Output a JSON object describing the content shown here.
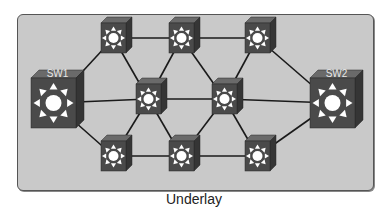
{
  "caption": "Underlay",
  "colors": {
    "panel_bg": "#c9c9c9",
    "switch_front": "#4a4a4a",
    "switch_top": "#6a6a6a",
    "switch_side": "#353535",
    "link": "#1a1a1a",
    "icon": "#ffffff"
  },
  "nodes": [
    {
      "id": "SW1",
      "label": "SW1",
      "x": 31,
      "y": 78,
      "w": 45,
      "h": 50,
      "big": true
    },
    {
      "id": "SW2",
      "label": "SW2",
      "x": 310,
      "y": 78,
      "w": 45,
      "h": 50,
      "big": true
    },
    {
      "id": "T1",
      "label": "",
      "x": 101,
      "y": 23,
      "w": 25,
      "h": 30
    },
    {
      "id": "T2",
      "label": "",
      "x": 169,
      "y": 23,
      "w": 25,
      "h": 30
    },
    {
      "id": "T3",
      "label": "",
      "x": 245,
      "y": 23,
      "w": 25,
      "h": 30
    },
    {
      "id": "M1",
      "label": "",
      "x": 136,
      "y": 84,
      "w": 25,
      "h": 30
    },
    {
      "id": "M2",
      "label": "",
      "x": 212,
      "y": 84,
      "w": 25,
      "h": 30
    },
    {
      "id": "B1",
      "label": "",
      "x": 101,
      "y": 141,
      "w": 25,
      "h": 30
    },
    {
      "id": "B2",
      "label": "",
      "x": 169,
      "y": 141,
      "w": 25,
      "h": 30
    },
    {
      "id": "B3",
      "label": "",
      "x": 245,
      "y": 141,
      "w": 25,
      "h": 30
    }
  ],
  "links": [
    [
      "SW1",
      "T1"
    ],
    [
      "SW1",
      "M1"
    ],
    [
      "SW1",
      "B1"
    ],
    [
      "T1",
      "T2"
    ],
    [
      "T2",
      "T3"
    ],
    [
      "T1",
      "M1"
    ],
    [
      "T2",
      "M1"
    ],
    [
      "T2",
      "M2"
    ],
    [
      "T3",
      "M2"
    ],
    [
      "M1",
      "M2"
    ],
    [
      "M1",
      "B1"
    ],
    [
      "M1",
      "B2"
    ],
    [
      "M2",
      "B2"
    ],
    [
      "M2",
      "B3"
    ],
    [
      "B1",
      "B2"
    ],
    [
      "B2",
      "B3"
    ],
    [
      "T3",
      "SW2"
    ],
    [
      "M2",
      "SW2"
    ],
    [
      "B3",
      "SW2"
    ]
  ]
}
